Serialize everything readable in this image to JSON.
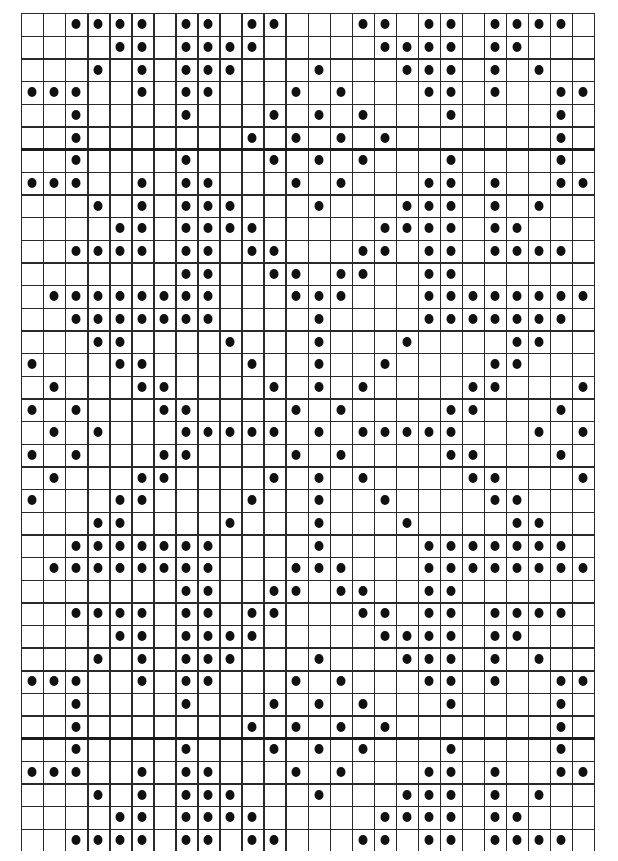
{
  "chart_data": {
    "type": "table",
    "title": "",
    "columns": 26,
    "rows": 37,
    "thick_lines_after_rows": [
      5,
      31
    ],
    "grid": true,
    "dot_color": "#111111",
    "line_color": "#2a2a2a",
    "dots": [
      [
        2,
        3,
        4,
        5,
        7,
        8,
        10,
        11,
        15,
        16,
        18,
        19,
        21,
        22,
        23,
        24
      ],
      [
        4,
        5,
        7,
        8,
        9,
        10,
        16,
        17,
        18,
        19,
        21,
        22
      ],
      [
        3,
        5,
        7,
        8,
        9,
        13,
        17,
        18,
        19,
        21,
        23
      ],
      [
        0,
        1,
        2,
        5,
        7,
        8,
        12,
        14,
        18,
        19,
        21,
        24,
        25
      ],
      [
        2,
        7,
        11,
        13,
        15,
        19,
        24
      ],
      [
        2,
        10,
        12,
        14,
        16,
        24
      ],
      [
        2,
        7,
        11,
        13,
        15,
        19,
        24
      ],
      [
        0,
        1,
        2,
        5,
        7,
        8,
        12,
        14,
        18,
        19,
        21,
        24,
        25
      ],
      [
        3,
        5,
        7,
        8,
        9,
        13,
        17,
        18,
        19,
        21,
        23
      ],
      [
        4,
        5,
        7,
        8,
        9,
        10,
        16,
        17,
        18,
        19,
        21,
        22
      ],
      [
        2,
        3,
        4,
        5,
        7,
        8,
        10,
        11,
        15,
        16,
        18,
        19,
        21,
        22,
        23,
        24
      ],
      [
        7,
        8,
        11,
        12,
        14,
        15,
        18,
        19
      ],
      [
        1,
        2,
        3,
        4,
        5,
        6,
        7,
        8,
        12,
        13,
        14,
        18,
        19,
        20,
        21,
        22,
        23,
        24,
        25
      ],
      [
        2,
        3,
        4,
        5,
        6,
        7,
        8,
        13,
        18,
        19,
        20,
        21,
        22,
        23,
        24
      ],
      [
        3,
        4,
        9,
        13,
        17,
        22,
        23
      ],
      [
        0,
        4,
        5,
        10,
        13,
        16,
        21,
        22
      ],
      [
        1,
        5,
        6,
        11,
        13,
        15,
        20,
        21,
        25
      ],
      [
        0,
        2,
        6,
        7,
        12,
        14,
        19,
        20,
        24
      ],
      [
        1,
        3,
        7,
        8,
        9,
        10,
        11,
        13,
        15,
        16,
        17,
        18,
        19,
        23,
        25
      ],
      [
        0,
        2,
        6,
        7,
        12,
        14,
        19,
        20,
        24
      ],
      [
        1,
        5,
        6,
        11,
        13,
        15,
        20,
        21,
        25
      ],
      [
        0,
        4,
        5,
        10,
        13,
        16,
        21,
        22
      ],
      [
        3,
        4,
        9,
        13,
        17,
        22,
        23
      ],
      [
        2,
        3,
        4,
        5,
        6,
        7,
        8,
        13,
        18,
        19,
        20,
        21,
        22,
        23,
        24
      ],
      [
        1,
        2,
        3,
        4,
        5,
        6,
        7,
        8,
        12,
        13,
        14,
        18,
        19,
        20,
        21,
        22,
        23,
        24,
        25
      ],
      [
        7,
        8,
        11,
        12,
        14,
        15,
        18,
        19
      ],
      [
        2,
        3,
        4,
        5,
        7,
        8,
        10,
        11,
        15,
        16,
        18,
        19,
        21,
        22,
        23,
        24
      ],
      [
        4,
        5,
        7,
        8,
        9,
        10,
        16,
        17,
        18,
        19,
        21,
        22
      ],
      [
        3,
        5,
        7,
        8,
        9,
        13,
        17,
        18,
        19,
        21,
        23
      ],
      [
        0,
        1,
        2,
        5,
        7,
        8,
        12,
        14,
        18,
        19,
        21,
        24,
        25
      ],
      [
        2,
        7,
        11,
        13,
        15,
        19,
        24
      ],
      [
        2,
        10,
        12,
        14,
        16,
        24
      ],
      [
        2,
        7,
        11,
        13,
        15,
        19,
        24
      ],
      [
        0,
        1,
        2,
        5,
        7,
        8,
        12,
        14,
        18,
        19,
        21,
        24,
        25
      ],
      [
        3,
        5,
        7,
        8,
        9,
        13,
        17,
        18,
        19,
        21,
        23
      ],
      [
        4,
        5,
        7,
        8,
        9,
        10,
        16,
        17,
        18,
        19,
        21,
        22
      ],
      [
        2,
        3,
        4,
        5,
        7,
        8,
        10,
        11,
        15,
        16,
        18,
        19,
        21,
        22,
        23,
        24
      ]
    ]
  },
  "layout": {
    "cell_width": 22.04,
    "row_heights_note": "rows ~22.66px"
  }
}
